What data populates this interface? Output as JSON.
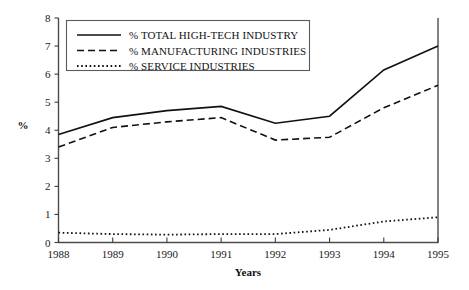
{
  "chart_data": {
    "type": "line",
    "title": "",
    "xlabel": "Years",
    "ylabel": "%",
    "categories": [
      "1988",
      "1989",
      "1990",
      "1991",
      "1992",
      "1993",
      "1994",
      "1995"
    ],
    "x": [
      1988,
      1989,
      1990,
      1991,
      1992,
      1993,
      1994,
      1995
    ],
    "xlim": [
      1988,
      1995
    ],
    "ylim": [
      0,
      8
    ],
    "y_ticks": [
      "0",
      "1",
      "2",
      "3",
      "4",
      "5",
      "6",
      "7",
      "8"
    ],
    "y_tick_values": [
      0,
      1,
      2,
      3,
      4,
      5,
      6,
      7,
      8
    ],
    "grid": false,
    "legend_position": "top-left",
    "series": [
      {
        "name": "% TOTAL HIGH-TECH INDUSTRY",
        "style": "solid",
        "values": [
          3.85,
          4.45,
          4.7,
          4.85,
          4.25,
          4.5,
          6.15,
          7.0
        ]
      },
      {
        "name": "% MANUFACTURING INDUSTRIES",
        "style": "dashed",
        "values": [
          3.4,
          4.1,
          4.3,
          4.45,
          3.65,
          3.75,
          4.8,
          5.6
        ]
      },
      {
        "name": "% SERVICE INDUSTRIES",
        "style": "dotted",
        "values": [
          0.35,
          0.3,
          0.28,
          0.3,
          0.3,
          0.45,
          0.75,
          0.9
        ]
      }
    ]
  },
  "legend": {
    "items": [
      {
        "label": "% TOTAL HIGH-TECH INDUSTRY",
        "style": "solid"
      },
      {
        "label": "% MANUFACTURING INDUSTRIES",
        "style": "dashed"
      },
      {
        "label": "% SERVICE INDUSTRIES",
        "style": "dotted"
      }
    ]
  },
  "axes": {
    "x_title": "Years",
    "y_title": "%"
  },
  "colors": {
    "line": "#111111",
    "axis": "#4c4c4c",
    "background": "#ffffff"
  }
}
